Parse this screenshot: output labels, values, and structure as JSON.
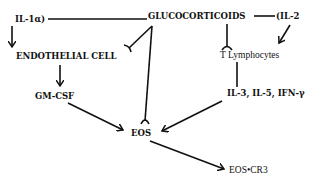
{
  "nodes": {
    "il1a": "IL-1α)",
    "glucocorticoids": "GLUCOCORTICOIDS",
    "il2": "(IL-2",
    "endothelial_cell": "ENDOTHELIAL CELL",
    "t_lymphocytes": "T Lymphocytes",
    "gm_csf": "GM-CSF",
    "il3_il5_ifng": "IL-3, IL-5, IFN-γ",
    "eos": "EOS",
    "eos_cr3": "EOS•CR3"
  },
  "edges": [
    {
      "from": "il1a",
      "to": "glucocorticoids",
      "type": "line"
    },
    {
      "from": "glucocorticoids",
      "to": "il2",
      "type": "line"
    },
    {
      "from": "il1a",
      "to": "endothelial_cell",
      "type": "arrow"
    },
    {
      "from": "glucocorticoids",
      "to": "endothelial_cell",
      "type": "inhibition"
    },
    {
      "from": "glucocorticoids",
      "to": "eos",
      "type": "inhibition"
    },
    {
      "from": "glucocorticoids",
      "to": "t_lymphocytes",
      "type": "inhibition"
    },
    {
      "from": "il2",
      "to": "t_lymphocytes",
      "type": "arrow"
    },
    {
      "from": "endothelial_cell",
      "to": "gm_csf",
      "type": "arrow"
    },
    {
      "from": "t_lymphocytes",
      "to": "il3_il5_ifng",
      "type": "line"
    },
    {
      "from": "gm_csf",
      "to": "eos",
      "type": "arrow"
    },
    {
      "from": "il3_il5_ifng",
      "to": "eos",
      "type": "arrow"
    },
    {
      "from": "eos",
      "to": "eos_cr3",
      "type": "arrow"
    }
  ],
  "colors": {
    "ink": "#111111",
    "background": "#ffffff"
  }
}
